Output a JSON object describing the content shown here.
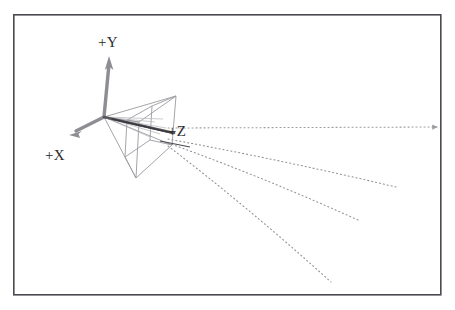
{
  "figure": {
    "kind": "3d-coordinate-axes-with-camera-frustum-and-rays",
    "caption": "",
    "background_color": "#ffffff",
    "frame": {
      "name": "figure-border",
      "x": 13,
      "y": 14,
      "width": 428,
      "height": 281,
      "stroke_color": "#4a4a50",
      "stroke_width": 1.6
    },
    "origin": {
      "x": 104,
      "y": 117
    },
    "axes": [
      {
        "id": "x",
        "label": "+X",
        "label_x": 45,
        "label_y": 160,
        "tip_x": 70,
        "tip_y": 134,
        "stroke_color": "#8d8d93",
        "stroke_width": 3.4
      },
      {
        "id": "y",
        "label": "+Y",
        "label_x": 98,
        "label_y": 47,
        "tip_x": 109,
        "tip_y": 56,
        "stroke_color": "#8d8d93",
        "stroke_width": 3.4
      },
      {
        "id": "z",
        "label": "+Z",
        "label_x": 168,
        "label_y": 136,
        "tip_x": 174,
        "tip_y": 133,
        "stroke_color": "#55555b",
        "stroke_width": 3.0
      }
    ],
    "frustum": {
      "name": "camera-view-frustum",
      "stroke_color": "#9a9aa0",
      "stroke_width": 0.9,
      "apex": {
        "x": 104,
        "y": 117
      },
      "far_face": [
        {
          "x": 176,
          "y": 96
        },
        {
          "x": 172,
          "y": 145
        },
        {
          "x": 136,
          "y": 178
        },
        {
          "x": 139,
          "y": 122
        }
      ],
      "near_face": [
        {
          "x": 152,
          "y": 106
        },
        {
          "x": 150,
          "y": 140
        },
        {
          "x": 125,
          "y": 157
        },
        {
          "x": 127,
          "y": 120
        }
      ]
    },
    "rays": [
      {
        "id": "ray-1",
        "description": "near-horizontal dotted ray",
        "from_x": 168,
        "from_y": 128,
        "to_x": 437,
        "to_y": 127,
        "arrow": true,
        "stroke_color": "#9b9ba1"
      },
      {
        "id": "ray-2",
        "description": "upper-slanted dotted ray",
        "from_x": 168,
        "from_y": 139,
        "to_x": 396,
        "to_y": 187,
        "arrow": false,
        "stroke_color": "#8f8f96"
      },
      {
        "id": "ray-3",
        "description": "middle-slanted dotted ray",
        "from_x": 168,
        "from_y": 143,
        "to_x": 358,
        "to_y": 220,
        "arrow": false,
        "stroke_color": "#8f8f96"
      },
      {
        "id": "ray-4",
        "description": "steep dotted ray",
        "from_x": 168,
        "from_y": 146,
        "to_x": 331,
        "to_y": 282,
        "arrow": false,
        "stroke_color": "#8f8f96"
      }
    ],
    "short_segments": [
      {
        "id": "tick-1",
        "from_x": 160,
        "from_y": 141,
        "to_x": 190,
        "to_y": 147,
        "stroke_color": "#4a4a50"
      }
    ]
  }
}
